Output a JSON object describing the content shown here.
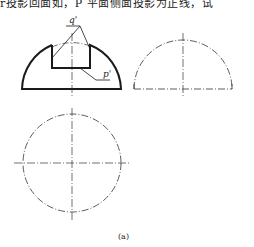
{
  "header": {
    "partial_text": "r投影回面如，P 平面侧面投影为正线，试"
  },
  "figure": {
    "label_q": "q'",
    "label_p": "p'",
    "caption": "(a)",
    "views": [
      "front-view",
      "side-view",
      "top-view"
    ],
    "colors": {
      "line": "#1a1a1a",
      "center_line": "#333333"
    }
  }
}
